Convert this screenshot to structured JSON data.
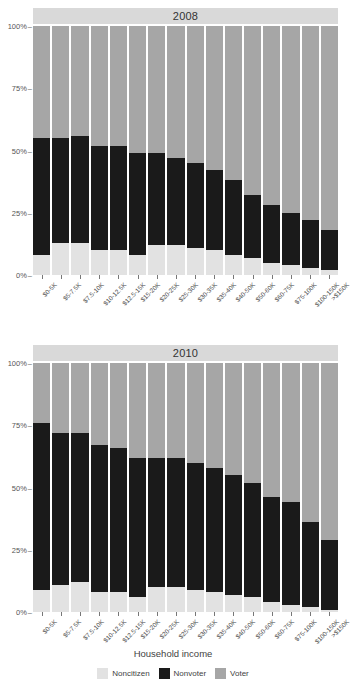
{
  "axis_title": "Household income",
  "legend": [
    {
      "label": "Noncitizen",
      "color": "#e2e2e2",
      "key": "noncitizen"
    },
    {
      "label": "Nonvoter",
      "color": "#1a1a1a",
      "key": "nonvoter"
    },
    {
      "label": "Voter",
      "color": "#a6a6a6",
      "key": "voter"
    }
  ],
  "y_ticks": [
    "0%",
    "25%",
    "50%",
    "75%",
    "100%"
  ],
  "chart_data": {
    "type": "bar",
    "subtype": "stacked-100-percent",
    "title": "",
    "xlabel": "Household income",
    "ylabel": "",
    "ylim": [
      0,
      100
    ],
    "ytick_values": [
      0,
      25,
      50,
      75,
      100
    ],
    "grid": false,
    "legend_position": "bottom",
    "legend_entries": [
      "Noncitizen",
      "Nonvoter",
      "Voter"
    ],
    "stack_order_bottom_to_top": [
      "Noncitizen",
      "Nonvoter",
      "Voter"
    ],
    "categories": [
      "$0-5K",
      "$5-7.5K",
      "$7.5-10K",
      "$10-12.5K",
      "$12.5-15K",
      "$15-20K",
      "$20-25K",
      "$25-30K",
      "$30-35K",
      "$35-40K",
      "$40-50K",
      "$50-60K",
      "$60-75K",
      "$75-100K",
      "$100-150K",
      ">$150K"
    ],
    "panels": [
      {
        "name": "2008",
        "series": [
          {
            "name": "Noncitizen",
            "values": [
              8,
              13,
              13,
              10,
              10,
              8,
              12,
              12,
              11,
              10,
              8,
              7,
              5,
              4,
              3,
              2
            ]
          },
          {
            "name": "Nonvoter",
            "values": [
              47,
              42,
              43,
              42,
              42,
              41,
              37,
              35,
              34,
              32,
              30,
              25,
              23,
              21,
              19,
              16
            ]
          },
          {
            "name": "Voter",
            "values": [
              45,
              45,
              44,
              48,
              48,
              51,
              51,
              53,
              55,
              58,
              62,
              68,
              72,
              75,
              78,
              82
            ]
          }
        ]
      },
      {
        "name": "2010",
        "series": [
          {
            "name": "Noncitizen",
            "values": [
              9,
              11,
              12,
              8,
              8,
              6,
              10,
              10,
              9,
              8,
              7,
              6,
              4,
              3,
              2,
              1
            ]
          },
          {
            "name": "Nonvoter",
            "values": [
              67,
              61,
              60,
              59,
              58,
              56,
              52,
              52,
              51,
              50,
              48,
              46,
              42,
              41,
              34,
              28
            ]
          },
          {
            "name": "Voter",
            "values": [
              24,
              28,
              28,
              33,
              34,
              38,
              38,
              38,
              40,
              42,
              45,
              48,
              54,
              56,
              64,
              71
            ]
          }
        ]
      }
    ]
  }
}
